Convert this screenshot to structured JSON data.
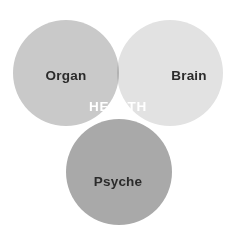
{
  "figure": {
    "type": "venn-diagram",
    "set_count": 3,
    "width": 237,
    "height": 236,
    "background_color": "#ffffff"
  },
  "circles": [
    {
      "id": "organ",
      "label": "Organ",
      "cx": 66,
      "cy": 73,
      "r": 53,
      "fill": "#c9c9c9",
      "label_color": "#2b2b2b",
      "position": "top-left"
    },
    {
      "id": "brain",
      "label": "Brain",
      "cx": 170,
      "cy": 73,
      "r": 53,
      "fill": "#e2e2e2",
      "label_color": "#2b2b2b",
      "position": "top-right"
    },
    {
      "id": "psyche",
      "label": "Psyche",
      "cx": 119,
      "cy": 172,
      "r": 53,
      "fill": "#a9a9a9",
      "label_color": "#2b2b2b",
      "position": "bottom-center"
    }
  ],
  "intersection": {
    "label": "HEALTH",
    "label_color": "#ffffff",
    "cx": 118,
    "cy": 106,
    "fill": "#8e8e8e"
  },
  "overlap_colors": {
    "organ_brain": "#b4b4b4",
    "organ_psyche": "#919191",
    "brain_psyche": "#a5a5a5",
    "all_three": "#8e8e8e"
  }
}
